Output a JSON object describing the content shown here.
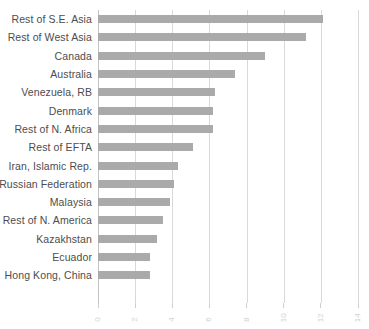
{
  "chart_data": {
    "type": "bar",
    "orientation": "horizontal",
    "title": "",
    "subtitle": "",
    "xlabel": "",
    "ylabel": "",
    "xlim": [
      0,
      14
    ],
    "ylim": null,
    "grid": true,
    "legend": null,
    "legend_position": "none",
    "xticks": [
      "0",
      "2",
      "4",
      "6",
      "8",
      "10",
      "12",
      "14"
    ],
    "xtick_values": [
      0,
      2,
      4,
      6,
      8,
      10,
      12,
      14
    ],
    "categories": [
      "Rest of S.E. Asia",
      "Rest of West Asia",
      "Canada",
      "Australia",
      "Venezuela, RB",
      "Denmark",
      "Rest of N. Africa",
      "Rest of EFTA",
      "Iran, Islamic Rep.",
      "Russian Federation",
      "Malaysia",
      "Rest of N. America",
      "Kazakhstan",
      "Ecuador",
      "Hong Kong, China"
    ],
    "values": [
      12.1,
      11.2,
      9.0,
      7.4,
      6.3,
      6.2,
      6.2,
      5.1,
      4.3,
      4.1,
      3.9,
      3.5,
      3.2,
      2.8,
      2.8
    ],
    "series": [
      {
        "name": "value",
        "values": [
          12.1,
          11.2,
          9.0,
          7.4,
          6.3,
          6.2,
          6.2,
          5.1,
          4.3,
          4.1,
          3.9,
          3.5,
          3.2,
          2.8,
          2.8
        ]
      }
    ],
    "colors": {
      "bar": "#aaaaaa",
      "grid": "#d9d9d9",
      "axis": "#c2c2c2",
      "label_text": "#4d4d4d",
      "tick_text": "#d2d2d2",
      "background": "#ffffff"
    }
  }
}
